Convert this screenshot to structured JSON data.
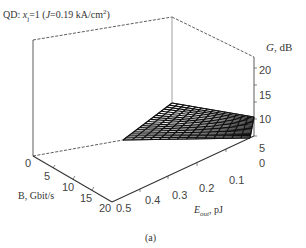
{
  "figure": {
    "title_prefix": "QD: ",
    "title_var": "x",
    "title_var_sub": "j",
    "title_eq": "=1 (",
    "title_J": "J",
    "title_rest": "=0.19 kA/cm",
    "title_sup": "2",
    "title_close": ")",
    "caption": "(a)"
  },
  "chart_data": {
    "type": "surface3d",
    "caption": "(a)",
    "axes": {
      "x": {
        "label": "E_out, pJ",
        "ticks": [
          "0.5",
          "0.4",
          "0.3",
          "0.2",
          "0.1"
        ],
        "range": [
          0.05,
          0.5
        ]
      },
      "y": {
        "label": "B, Gbit/s",
        "ticks": [
          "0",
          "5",
          "10",
          "15",
          "20"
        ],
        "range": [
          0,
          20
        ]
      },
      "z": {
        "label": "G, dB",
        "ticks": [
          "0",
          "5",
          "10",
          "15",
          "20"
        ],
        "range": [
          0,
          23
        ]
      }
    },
    "surface_description": "Mesh surface; gain highest (~13 dB) at low E_out (~0.05 pJ) and B=0, decreasing toward higher E_out and higher bit rates (~6 dB at 0.05 pJ, B=20; ~0 at 0.5 pJ).",
    "samples": [
      {
        "E_out": 0.05,
        "B": 0,
        "G": 13
      },
      {
        "E_out": 0.05,
        "B": 20,
        "G": 6
      },
      {
        "E_out": 0.3,
        "B": 0,
        "G": 5
      },
      {
        "E_out": 0.5,
        "B": 0,
        "G": 1
      },
      {
        "E_out": 0.3,
        "B": 20,
        "G": 1
      }
    ],
    "grid": false,
    "box": true
  },
  "axes": {
    "z_label_var": "G",
    "z_label_unit": ", dB",
    "z_ticks": [
      "20",
      "15",
      "10",
      "5",
      "0"
    ],
    "y_label": "B, Gbit/s",
    "y_ticks": [
      "0",
      "5",
      "10",
      "15",
      "20"
    ],
    "x_label_var": "E",
    "x_label_sub": "out",
    "x_label_unit": ", pJ",
    "x_ticks": [
      "0.5",
      "0.4",
      "0.3",
      "0.2",
      "0.1"
    ]
  }
}
